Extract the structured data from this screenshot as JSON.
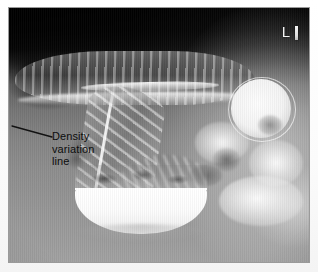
{
  "figure": {
    "type": "radiograph",
    "modality": "barium-contrast-abdominal-radiograph",
    "anatomy": "colon",
    "view": "anteroposterior"
  },
  "markers": {
    "laterality": "L",
    "laterality_icon": "laterality-marker-icon",
    "pin_icon": "marker-pin-icon"
  },
  "annotations": [
    {
      "id": "density-variation",
      "lines": [
        "Density",
        "variation",
        "line"
      ],
      "text": "Density variation line",
      "text_color": "#0d0d0d",
      "leader": {
        "x1": 12,
        "y1": 126,
        "x2": 52,
        "y2": 137,
        "color": "#121212",
        "width": 1.3
      },
      "label_position": {
        "x": 52,
        "y": 130
      }
    }
  ],
  "image_regions": {
    "transverse_colon": "haustrated gas filled transverse colon across upper field",
    "descending_colon": "haustrated diagonal colon segment mid field",
    "contrast_loops": "bright barium filled bowel loops right field",
    "barium_pool": "dense barium pool with air-fluid level lower center",
    "gas_band": "dark gas band upper left"
  },
  "colors": {
    "frame_border": "#9a9a9a",
    "mount_background": "#fdfdfd",
    "film_dark": "#0a0a0a",
    "film_mid": "#848484",
    "film_bright": "#fefefe",
    "marker_white": "#f2f2f2"
  },
  "layout": {
    "canvas_width": 318,
    "canvas_height": 272,
    "frame": {
      "x": 8,
      "y": 7,
      "width": 302,
      "height": 256
    }
  }
}
